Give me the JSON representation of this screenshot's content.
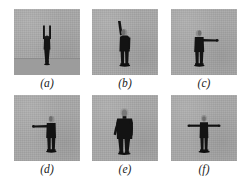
{
  "figure": {
    "layout": {
      "rows": 2,
      "cols": 3,
      "panel_count": 6
    },
    "colors": {
      "page_background": "#ffffff",
      "panel_background": "#a9a9a9",
      "ground_band": "#9c9c9c",
      "silhouette": "#131313",
      "head_highlight": "#8f8f8f",
      "label_text": "#1a1a1a"
    },
    "panels": [
      {
        "id": "a",
        "label": "(a)",
        "pose": "both-arms-raised-overhead",
        "description": "Distant figure standing with both arms raised straight up overhead",
        "has_ground_band": true,
        "figure_scale": "small"
      },
      {
        "id": "b",
        "label": "(b)",
        "pose": "single-arm-raised-up",
        "description": "Figure standing frontally with right arm raised vertically above the head",
        "has_ground_band": false,
        "figure_scale": "medium"
      },
      {
        "id": "c",
        "label": "(c)",
        "pose": "single-arm-extended-right",
        "description": "Figure standing with one arm extended horizontally to the viewer's right",
        "has_ground_band": false,
        "figure_scale": "medium"
      },
      {
        "id": "d",
        "label": "(d)",
        "pose": "single-arm-extended-left",
        "description": "Figure standing with one arm extended horizontally to the viewer's left",
        "has_ground_band": false,
        "figure_scale": "medium"
      },
      {
        "id": "e",
        "label": "(e)",
        "pose": "walking-arms-at-sides",
        "description": "Larger figure walking toward the camera with arms hanging at the sides",
        "has_ground_band": false,
        "figure_scale": "large"
      },
      {
        "id": "f",
        "label": "(f)",
        "pose": "both-arms-extended-t-pose",
        "description": "Figure standing with both arms extended horizontally in a T-pose",
        "has_ground_band": false,
        "figure_scale": "medium"
      }
    ]
  }
}
